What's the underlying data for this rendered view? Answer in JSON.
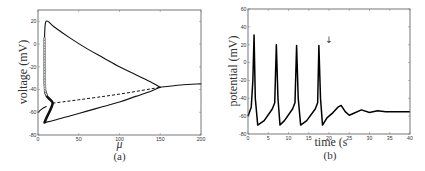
{
  "chart_data": [
    {
      "id": "a",
      "type": "line",
      "panel_label": "(a)",
      "title": "",
      "xlabel": "μ",
      "ylabel": "voltage (mV)",
      "xlim": [
        0,
        200
      ],
      "ylim": [
        -80,
        30
      ],
      "xticks": [
        0,
        50,
        100,
        150,
        200
      ],
      "yticks": [
        20,
        0,
        -20,
        -40,
        -60,
        -80
      ],
      "grid": false,
      "series": [
        {
          "name": "limit cycle max (stable)",
          "style": "solid",
          "x": [
            8,
            9,
            12,
            20,
            40,
            60,
            80,
            100,
            120,
            140,
            150
          ],
          "y": [
            5,
            18,
            20,
            15,
            5,
            -4,
            -12,
            -20,
            -27,
            -34,
            -38
          ]
        },
        {
          "name": "limit cycle min (stable)",
          "style": "solid",
          "x": [
            8,
            20,
            40,
            60,
            80,
            100,
            120,
            140,
            150
          ],
          "y": [
            -69,
            -67,
            -63,
            -59,
            -55,
            -51,
            -46,
            -41,
            -38
          ]
        },
        {
          "name": "unstable equilibrium",
          "style": "dashed",
          "x": [
            18,
            50,
            100,
            150
          ],
          "y": [
            -52,
            -49,
            -44,
            -38
          ]
        },
        {
          "name": "stable equilibrium (low)",
          "style": "solid",
          "x": [
            0,
            5,
            10
          ],
          "y": [
            -60,
            -57,
            -55
          ]
        },
        {
          "name": "stable equilibrium (high)",
          "style": "solid",
          "x": [
            150,
            175,
            200
          ],
          "y": [
            -38,
            -36,
            -35
          ]
        },
        {
          "name": "unstable limit cycle",
          "style": "circles",
          "x": [
            8,
            8,
            8,
            9,
            11,
            15,
            18,
            15,
            11,
            8
          ],
          "y": [
            5,
            -20,
            -35,
            -42,
            -46,
            -49,
            -52,
            -58,
            -64,
            -69
          ]
        }
      ]
    },
    {
      "id": "b",
      "type": "line",
      "panel_label": "(b)",
      "title": "",
      "xlabel": "time (s",
      "ylabel": "potential (mV)",
      "xlim": [
        0,
        40
      ],
      "ylim": [
        -80,
        60
      ],
      "xticks": [
        0,
        5,
        10,
        15,
        20,
        25,
        30,
        35,
        40
      ],
      "yticks": [
        60,
        40,
        20,
        0,
        -20,
        -40,
        -60,
        -80
      ],
      "grid": false,
      "annotation": {
        "type": "arrow-down",
        "x": 20,
        "y": 25,
        "glyph": "↓"
      },
      "series": [
        {
          "name": "membrane potential",
          "x": [
            0,
            0.8,
            1.2,
            1.5,
            1.8,
            2.4,
            4,
            6,
            6.6,
            7,
            7.4,
            7.9,
            9,
            11,
            11.6,
            12,
            12.4,
            13,
            14.5,
            16.6,
            17.2,
            17.5,
            17.9,
            18.4,
            19.5,
            21,
            22.2,
            23,
            24,
            25,
            26,
            28,
            30,
            32,
            34,
            36,
            40
          ],
          "y": [
            -60,
            -50,
            -20,
            31,
            -40,
            -70,
            -65,
            -52,
            -45,
            20,
            -40,
            -70,
            -65,
            -52,
            -45,
            19,
            -40,
            -70,
            -65,
            -52,
            -45,
            19,
            -40,
            -70,
            -62,
            -56,
            -50,
            -48,
            -55,
            -59,
            -57,
            -53,
            -56,
            -54,
            -55,
            -55,
            -55
          ]
        }
      ]
    }
  ]
}
